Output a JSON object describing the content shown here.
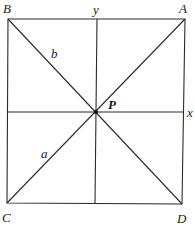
{
  "diagram": {
    "type": "geometry",
    "points": {
      "B": {
        "label": "B",
        "x": 8,
        "y": 19
      },
      "A": {
        "label": "A",
        "x": 185,
        "y": 19
      },
      "C": {
        "label": "C",
        "x": 7,
        "y": 203
      },
      "D": {
        "label": "D",
        "x": 182,
        "y": 204
      },
      "P": {
        "label": "P",
        "x": 96,
        "y": 112
      }
    },
    "axes": {
      "x": {
        "label": "x"
      },
      "y": {
        "label": "y"
      }
    },
    "segment_labels": {
      "b": {
        "label": "b",
        "segment": "BP"
      },
      "a": {
        "label": "a",
        "segment": "CP"
      }
    },
    "colors": {
      "stroke": "#2a2a2a",
      "background": "#ffffff",
      "text": "#1a1a1a"
    }
  }
}
